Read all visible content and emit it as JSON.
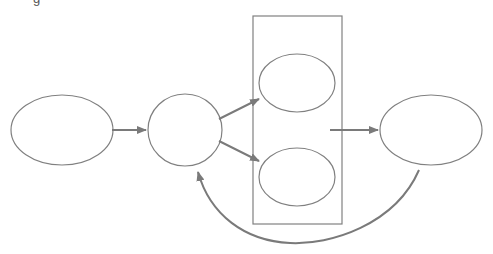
{
  "diagram": {
    "title_fragment": "g",
    "colors": {
      "stroke": "#808080",
      "arrow": "#7a7a7a",
      "background": "#ffffff"
    },
    "nodes": [
      {
        "id": "input-ellipse",
        "shape": "ellipse",
        "label": "",
        "cx": 62,
        "cy": 130,
        "rx": 51,
        "ry": 35
      },
      {
        "id": "hub-circle",
        "shape": "ellipse",
        "label": "",
        "cx": 185,
        "cy": 130,
        "rx": 37,
        "ry": 36
      },
      {
        "id": "upper-ellipse",
        "shape": "ellipse",
        "label": "",
        "cx": 297,
        "cy": 83,
        "rx": 38,
        "ry": 29
      },
      {
        "id": "lower-ellipse",
        "shape": "ellipse",
        "label": "",
        "cx": 297,
        "cy": 177,
        "rx": 38,
        "ry": 29
      },
      {
        "id": "output-ellipse",
        "shape": "ellipse",
        "label": "",
        "cx": 431,
        "cy": 130,
        "rx": 51,
        "ry": 35
      }
    ],
    "group": {
      "id": "parallel-box",
      "label": "",
      "x": 253,
      "y": 16,
      "width": 89,
      "height": 208
    },
    "edges": [
      {
        "from": "input-ellipse",
        "to": "hub-circle"
      },
      {
        "from": "hub-circle",
        "to": "upper-ellipse"
      },
      {
        "from": "hub-circle",
        "to": "lower-ellipse"
      },
      {
        "from": "parallel-box",
        "to": "output-ellipse"
      },
      {
        "from": "output-ellipse",
        "to": "hub-circle",
        "type": "curved-feedback"
      }
    ]
  }
}
